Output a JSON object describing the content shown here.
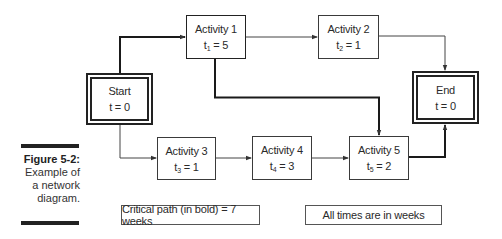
{
  "caption": {
    "figure_label": "Figure 5-2:",
    "line1": "Example of",
    "line2": "a network",
    "line3": "diagram."
  },
  "nodes": {
    "start": {
      "title": "Start",
      "time_var": "t",
      "time_sub": "",
      "time_value": "0",
      "eq": " = "
    },
    "a1": {
      "title": "Activity 1",
      "time_var": "t",
      "time_sub": "1",
      "time_value": "5",
      "eq": " = "
    },
    "a2": {
      "title": "Activity 2",
      "time_var": "t",
      "time_sub": "2",
      "time_value": "1",
      "eq": " = "
    },
    "a3": {
      "title": "Activity 3",
      "time_var": "t",
      "time_sub": "3",
      "time_value": "1",
      "eq": " = "
    },
    "a4": {
      "title": "Activity 4",
      "time_var": "t",
      "time_sub": "4",
      "time_value": "3",
      "eq": " = "
    },
    "a5": {
      "title": "Activity 5",
      "time_var": "t",
      "time_sub": "5",
      "time_value": "2",
      "eq": " = "
    },
    "end": {
      "title": "End",
      "time_var": "t",
      "time_sub": "",
      "time_value": "0",
      "eq": " = "
    }
  },
  "edges": [
    {
      "from": "Start",
      "to": "Activity 1",
      "critical": true
    },
    {
      "from": "Activity 1",
      "to": "Activity 2",
      "critical": false
    },
    {
      "from": "Activity 2",
      "to": "End",
      "critical": false
    },
    {
      "from": "Activity 1",
      "to": "Activity 5",
      "critical": true
    },
    {
      "from": "Start",
      "to": "Activity 3",
      "critical": false
    },
    {
      "from": "Activity 3",
      "to": "Activity 4",
      "critical": false
    },
    {
      "from": "Activity 4",
      "to": "Activity 5",
      "critical": false
    },
    {
      "from": "Activity 5",
      "to": "End",
      "critical": true
    }
  ],
  "notes": {
    "critical_path": "Critical path (in bold) = 7 weeks",
    "units": "All times are in weeks"
  },
  "colors": {
    "line": "#333333",
    "critical_line": "#1a1a1a",
    "bar": "#222222"
  }
}
